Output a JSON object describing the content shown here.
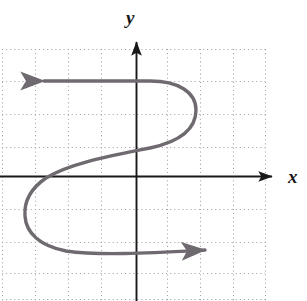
{
  "figure": {
    "width": 307,
    "height": 301,
    "background": "#ffffff"
  },
  "axes": {
    "x_axis": {
      "label": "x",
      "label_x": 295,
      "label_y": 178,
      "line_y": 176,
      "x_start": 2,
      "x_end": 278,
      "color": "#1a181b",
      "arrow": "right"
    },
    "y_axis": {
      "label": "y",
      "label_x": 133,
      "label_y": 18,
      "line_x": 136,
      "y_start": 36,
      "y_end": 301,
      "color": "#1a181b",
      "arrow": "up"
    }
  },
  "grid": {
    "style": "dotted",
    "color": "#a9a4ad",
    "dot_size": 1,
    "spacing_x": 33,
    "spacing_y": 32.5,
    "x_lines": [
      2,
      35,
      68,
      101,
      134,
      167,
      200,
      233,
      265
    ],
    "y_lines": [
      49,
      82,
      114,
      147,
      176,
      210,
      242,
      273,
      299
    ],
    "extent_left": 2,
    "extent_right": 265,
    "extent_top": 49,
    "extent_bottom": 299
  },
  "chart_data": {
    "type": "line",
    "title": "",
    "xlabel": "x",
    "ylabel": "y",
    "grid": true,
    "legend": null,
    "series": [
      {
        "name": "s-curve",
        "color": "#6f6a70",
        "stroke_width": 3.4,
        "start_arrow": true,
        "end_arrow": true,
        "points_px": [
          [
            44,
            81
          ],
          [
            120,
            81
          ],
          [
            168,
            82
          ],
          [
            192,
            95
          ],
          [
            196,
            112
          ],
          [
            186,
            132
          ],
          [
            150,
            147
          ],
          [
            96,
            160
          ],
          [
            52,
            176
          ],
          [
            30,
            196
          ],
          [
            25,
            216
          ],
          [
            33,
            237
          ],
          [
            60,
            250
          ],
          [
            120,
            253
          ],
          [
            175,
            251
          ],
          [
            205,
            250
          ]
        ],
        "path_d": "M 44 81 L 150 81 C 178 81 196 92 196 110 C 196 130 178 142 150 148 C 110 156 70 163 46 178 C 30 189 24 203 25 216 C 26 233 40 246 66 251 C 100 256 150 253 205 250"
      }
    ]
  },
  "labels": {
    "y": "y",
    "x": "x"
  }
}
